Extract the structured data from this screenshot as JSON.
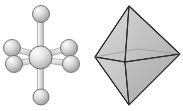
{
  "figure": {
    "background_color": "#ffffff",
    "width": 183,
    "height": 111,
    "panels": [
      {
        "id": "ball-stick",
        "label": "Ball-and-stick model"
      },
      {
        "id": "octahedron",
        "label": "Octahedron solid"
      }
    ]
  },
  "ball_stick": {
    "label": "Ball-and-stick model",
    "bond_color": "#9a9a9a",
    "bond_fill": "#d8d8d8",
    "atom_outline_color": "#6b6b6b",
    "atom_highlight_color": "#f2f2f2",
    "atom_shadow_color": "#8e8e8e",
    "center_atom": {
      "name": "central-atom",
      "cx": 40.5,
      "cy": 57.5,
      "r": 11.5
    },
    "ligands": [
      {
        "name": "ligand-axial-top",
        "cx": 41.0,
        "cy": 14.0,
        "r": 8.5
      },
      {
        "name": "ligand-axial-bottom",
        "cx": 41.0,
        "cy": 97.0,
        "r": 8.0
      },
      {
        "name": "ligand-equatorial-upper-left",
        "cx": 12.0,
        "cy": 48.0,
        "r": 8.5
      },
      {
        "name": "ligand-equatorial-lower-left",
        "cx": 14.0,
        "cy": 64.0,
        "r": 8.5
      },
      {
        "name": "ligand-equatorial-upper-right",
        "cx": 69.0,
        "cy": 48.0,
        "r": 8.5
      },
      {
        "name": "ligand-equatorial-lower-right",
        "cx": 71.0,
        "cy": 64.0,
        "r": 8.5
      }
    ],
    "bond_count": 6
  },
  "octahedron": {
    "label": "Octahedron solid",
    "edge_color": "#2b2b2b",
    "vertices": {
      "top": {
        "x": 37.0,
        "y": 6.0
      },
      "bottom": {
        "x": 37.0,
        "y": 105.0
      },
      "left": {
        "x": 3.0,
        "y": 57.0
      },
      "right": {
        "x": 88.0,
        "y": 54.0
      },
      "front": {
        "x": 33.0,
        "y": 62.0
      },
      "back": {
        "x": 46.0,
        "y": 49.0
      }
    },
    "faces": [
      {
        "name": "face-top-left-front",
        "fill": "#d4d4d4"
      },
      {
        "name": "face-top-front-right",
        "fill": "#c2c2c2"
      },
      {
        "name": "face-bottom-left-front",
        "fill": "#cccccc"
      },
      {
        "name": "face-bottom-front-right",
        "fill": "#b4b4b4"
      },
      {
        "name": "face-top-left-back",
        "fill": "#dedede"
      },
      {
        "name": "face-top-back-right",
        "fill": "#bfbfbf"
      }
    ],
    "face_count": 8,
    "vertex_count": 6,
    "edge_count": 12
  }
}
